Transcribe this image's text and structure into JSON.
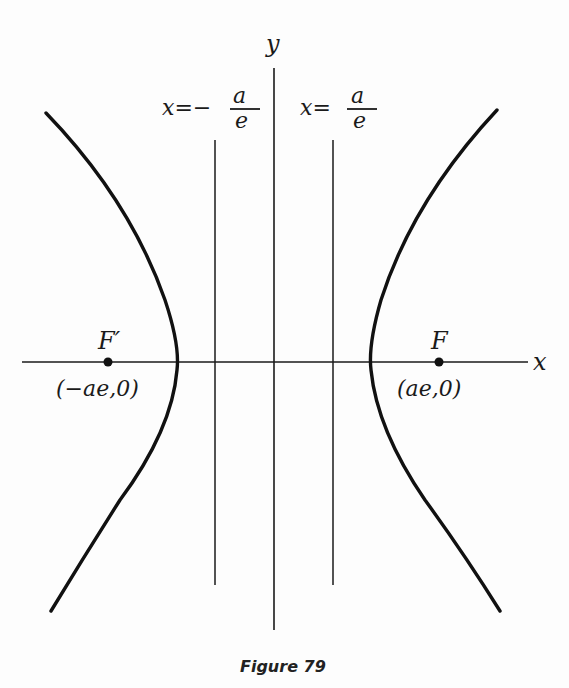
{
  "figure": {
    "caption": "Figure 79",
    "axes": {
      "x_label": "x",
      "y_label": "y"
    },
    "directrices": {
      "left": {
        "eq_prefix": "x=−",
        "numerator": "a",
        "denominator": "e"
      },
      "right": {
        "eq_prefix": "x=",
        "numerator": "a",
        "denominator": "e"
      }
    },
    "foci": {
      "left": {
        "label": "F′",
        "coords": "(−ae,0)"
      },
      "right": {
        "label": "F",
        "coords": "(ae,0)"
      }
    },
    "curve": "hyperbola",
    "colors": {
      "ink": "#1a1a1a",
      "background": "#fdfdfd"
    }
  }
}
